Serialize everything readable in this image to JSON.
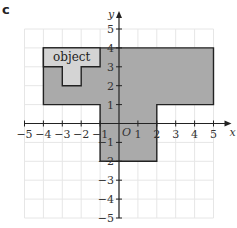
{
  "part_label": "c",
  "axes": {
    "x_label": "x",
    "y_label": "y",
    "origin_label": "O",
    "x_ticks": [
      -5,
      -4,
      -3,
      -2,
      -1,
      1,
      2,
      3,
      4,
      5
    ],
    "y_ticks": [
      5,
      4,
      3,
      2,
      1,
      -1,
      -2,
      -3,
      -4,
      -5
    ],
    "x_range": [
      -5,
      5
    ],
    "y_range": [
      -5,
      5
    ]
  },
  "shapes": {
    "image": {
      "name": "enlarged image",
      "fill": "#aaaaaa",
      "stroke": "#222222",
      "vertices": [
        [
          -4,
          4
        ],
        [
          5,
          4
        ],
        [
          5,
          1
        ],
        [
          2,
          1
        ],
        [
          2,
          -2
        ],
        [
          -1,
          -2
        ],
        [
          -1,
          1
        ],
        [
          -4,
          1
        ]
      ]
    },
    "object": {
      "label": "object",
      "fill": "#d4d4d4",
      "stroke": "#222222",
      "vertices": [
        [
          -4,
          4
        ],
        [
          -1,
          4
        ],
        [
          -1,
          3
        ],
        [
          -2,
          3
        ],
        [
          -2,
          2
        ],
        [
          -3,
          2
        ],
        [
          -3,
          3
        ],
        [
          -4,
          3
        ]
      ]
    }
  },
  "colors": {
    "grid": "#e6e6e6",
    "axis": "#222222",
    "text": "#333333"
  }
}
